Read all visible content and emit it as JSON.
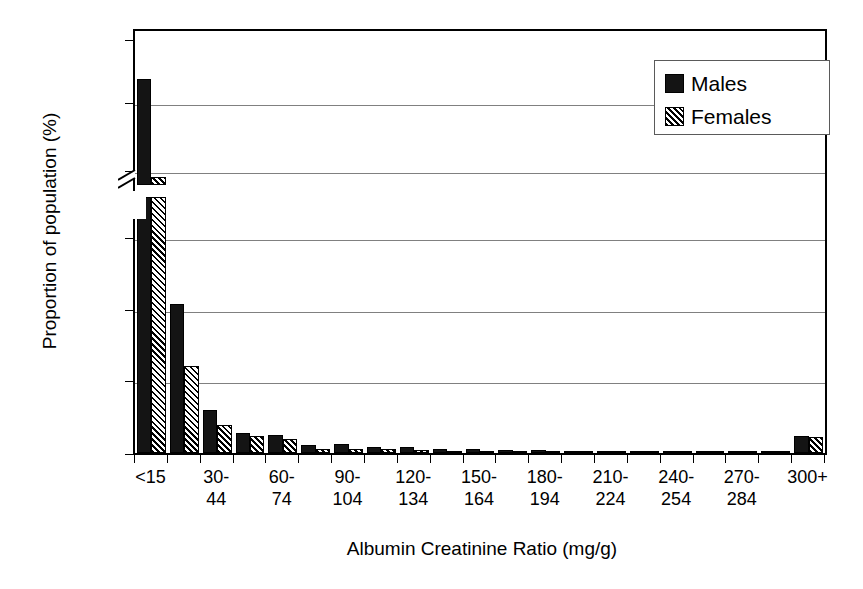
{
  "chart_data": {
    "type": "bar",
    "title": "",
    "xlabel": "Albumin Creatinine Ratio (mg/g)",
    "ylabel": "Proportion of population (%)",
    "grid": true,
    "legend_position": "top-right",
    "broken_axis": true,
    "ylim_lower": [
      0,
      17
    ],
    "ylim_upper": [
      79,
      90
    ],
    "yticks_lower": [
      "0",
      "5",
      "10",
      "15"
    ],
    "yticks_upper": [
      "80",
      "85",
      "90"
    ],
    "yticks_all": [
      "0",
      "5",
      "10",
      "15",
      "80",
      "85",
      "90"
    ],
    "categories": [
      "<15",
      "15-29",
      "30-44",
      "45-59",
      "60-74",
      "75-89",
      "90-104",
      "105-119",
      "120-134",
      "135-149",
      "150-164",
      "165-179",
      "180-194",
      "195-209",
      "210-224",
      "225-239",
      "240-254",
      "255-269",
      "270-284",
      "285-299",
      "300+"
    ],
    "tick_labels": [
      {
        "line1": "<15",
        "line2": ""
      },
      {
        "line1": "30-",
        "line2": "44"
      },
      {
        "line1": "60-",
        "line2": "74"
      },
      {
        "line1": "90-",
        "line2": "104"
      },
      {
        "line1": "120-",
        "line2": "134"
      },
      {
        "line1": "150-",
        "line2": "164"
      },
      {
        "line1": "180-",
        "line2": "194"
      },
      {
        "line1": "210-",
        "line2": "224"
      },
      {
        "line1": "240-",
        "line2": "254"
      },
      {
        "line1": "270-",
        "line2": "284"
      },
      {
        "line1": "300+",
        "line2": ""
      }
    ],
    "series": [
      {
        "name": "Males",
        "color": "#141414",
        "fill": "solid",
        "values": [
          87.0,
          10.5,
          3.0,
          1.4,
          1.3,
          0.55,
          0.65,
          0.4,
          0.45,
          0.25,
          0.25,
          0.2,
          0.2,
          0.15,
          0.15,
          0.1,
          0.1,
          0.07,
          0.05,
          0.05,
          1.2
        ]
      },
      {
        "name": "Females",
        "color": "#ffffff",
        "fill": "diagonal-hatch",
        "values": [
          79.7,
          6.1,
          2.0,
          1.2,
          1.0,
          0.3,
          0.25,
          0.25,
          0.2,
          0.12,
          0.12,
          0.1,
          0.1,
          0.08,
          0.08,
          0.06,
          0.05,
          0.04,
          0.03,
          0.03,
          1.1
        ]
      }
    ]
  },
  "legend": {
    "items": [
      {
        "label": "Males",
        "swatch": "solid-black"
      },
      {
        "label": "Females",
        "swatch": "hatched"
      }
    ]
  }
}
